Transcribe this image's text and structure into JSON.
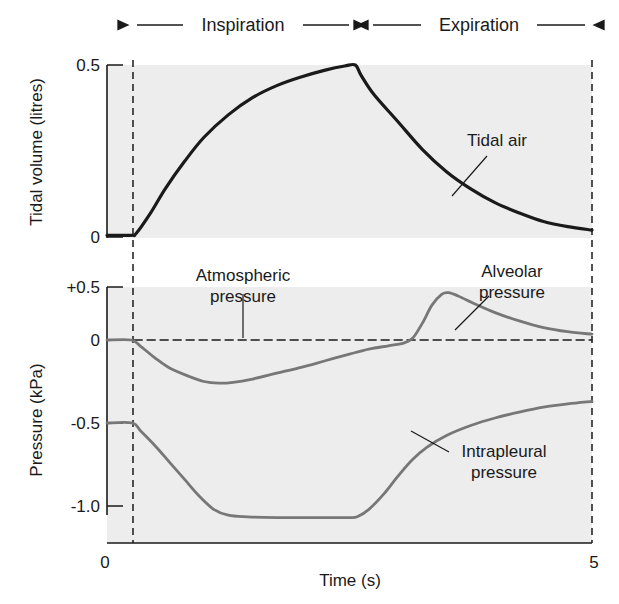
{
  "figure": {
    "phases": [
      {
        "label": "Inspiration",
        "arrow_left_x": 128,
        "arrow_right_x": 358,
        "text_x": 243,
        "text_y": 25
      },
      {
        "label": "Expiration",
        "arrow_left_x": 364,
        "arrow_right_x": 594,
        "text_x": 479,
        "text_y": 25
      }
    ],
    "axes": {
      "top": {
        "ylabel": "Tidal volume (litres)",
        "ticks": [
          "0.5",
          "0"
        ]
      },
      "bottom": {
        "ylabel": "Pressure (kPa)",
        "ticks": [
          "+0.5",
          "0",
          "-0.5",
          "-1.0"
        ]
      },
      "x": {
        "label": "Time (s)",
        "ticks": [
          "0",
          "5"
        ]
      }
    },
    "annotations": [
      {
        "name": "tidal-air",
        "lines": [
          "Tidal air"
        ],
        "x": 497,
        "y": 146
      },
      {
        "name": "atmospheric-pressure",
        "lines": [
          "Atmospheric",
          "pressure"
        ],
        "x": 243,
        "y": 281
      },
      {
        "name": "alveolar-pressure",
        "lines": [
          "Alveolar",
          "pressure"
        ],
        "x": 512,
        "y": 277
      },
      {
        "name": "intrapleural-pressure",
        "lines": [
          "Intrapleural",
          "pressure"
        ],
        "x": 504,
        "y": 457
      }
    ],
    "colors": {
      "plot_background": "#ededed",
      "axis": "#1a1a1a",
      "tidal_curve": "#1a1a1a",
      "pressure_curve": "#777777",
      "dashed_guide": "#1a1a1a"
    }
  },
  "chart_data": {
    "type": "line",
    "title": "",
    "xlabel": "Time (s)",
    "xlim": [
      0,
      5
    ],
    "x_ticks": [
      0,
      5
    ],
    "grid": false,
    "legend": "inline-annotations",
    "panels": [
      {
        "name": "tidal-volume",
        "ylabel": "Tidal volume (litres)",
        "ylim": [
          0,
          0.5
        ],
        "y_ticks": [
          0,
          0.5
        ],
        "series": [
          {
            "name": "Tidal air",
            "color": "#1a1a1a",
            "points": [
              [
                0.0,
                0.005
              ],
              [
                0.25,
                0.005
              ],
              [
                0.3,
                0.01
              ],
              [
                0.45,
                0.07
              ],
              [
                0.6,
                0.14
              ],
              [
                0.8,
                0.22
              ],
              [
                1.0,
                0.29
              ],
              [
                1.25,
                0.355
              ],
              [
                1.5,
                0.405
              ],
              [
                1.75,
                0.44
              ],
              [
                2.0,
                0.465
              ],
              [
                2.25,
                0.485
              ],
              [
                2.45,
                0.497
              ],
              [
                2.56,
                0.5
              ],
              [
                2.62,
                0.47
              ],
              [
                2.75,
                0.415
              ],
              [
                3.0,
                0.335
              ],
              [
                3.25,
                0.255
              ],
              [
                3.5,
                0.19
              ],
              [
                3.75,
                0.14
              ],
              [
                4.0,
                0.1
              ],
              [
                4.25,
                0.07
              ],
              [
                4.5,
                0.045
              ],
              [
                4.75,
                0.03
              ],
              [
                5.0,
                0.02
              ]
            ]
          }
        ]
      },
      {
        "name": "pressure",
        "ylabel": "Pressure (kPa)",
        "ylim": [
          -1.15,
          0.5
        ],
        "y_ticks": [
          0.5,
          0,
          -0.5,
          -1.0
        ],
        "series": [
          {
            "name": "Atmospheric pressure",
            "color": "#1a1a1a",
            "style": "dashed",
            "points": [
              [
                0.28,
                0.0
              ],
              [
                5.0,
                0.0
              ]
            ]
          },
          {
            "name": "Alveolar pressure",
            "color": "#777777",
            "points": [
              [
                0.0,
                0.0
              ],
              [
                0.25,
                0.0
              ],
              [
                0.35,
                -0.04
              ],
              [
                0.5,
                -0.11
              ],
              [
                0.65,
                -0.17
              ],
              [
                0.85,
                -0.22
              ],
              [
                1.0,
                -0.25
              ],
              [
                1.15,
                -0.26
              ],
              [
                1.3,
                -0.255
              ],
              [
                1.5,
                -0.235
              ],
              [
                1.75,
                -0.2
              ],
              [
                2.0,
                -0.165
              ],
              [
                2.25,
                -0.125
              ],
              [
                2.5,
                -0.085
              ],
              [
                2.7,
                -0.055
              ],
              [
                2.9,
                -0.035
              ],
              [
                3.05,
                -0.02
              ],
              [
                3.15,
                0.01
              ],
              [
                3.25,
                0.1
              ],
              [
                3.35,
                0.21
              ],
              [
                3.45,
                0.275
              ],
              [
                3.52,
                0.285
              ],
              [
                3.62,
                0.265
              ],
              [
                3.8,
                0.215
              ],
              [
                4.0,
                0.165
              ],
              [
                4.25,
                0.115
              ],
              [
                4.5,
                0.075
              ],
              [
                4.75,
                0.05
              ],
              [
                5.0,
                0.035
              ]
            ]
          },
          {
            "name": "Intrapleural pressure",
            "color": "#777777",
            "points": [
              [
                0.0,
                -0.5
              ],
              [
                0.26,
                -0.5
              ],
              [
                0.35,
                -0.55
              ],
              [
                0.5,
                -0.64
              ],
              [
                0.65,
                -0.74
              ],
              [
                0.8,
                -0.84
              ],
              [
                0.95,
                -0.94
              ],
              [
                1.1,
                -1.02
              ],
              [
                1.25,
                -1.055
              ],
              [
                1.45,
                -1.065
              ],
              [
                1.75,
                -1.07
              ],
              [
                2.1,
                -1.07
              ],
              [
                2.4,
                -1.07
              ],
              [
                2.5,
                -1.07
              ],
              [
                2.58,
                -1.065
              ],
              [
                2.7,
                -1.02
              ],
              [
                2.85,
                -0.93
              ],
              [
                3.0,
                -0.82
              ],
              [
                3.15,
                -0.72
              ],
              [
                3.3,
                -0.645
              ],
              [
                3.5,
                -0.575
              ],
              [
                3.75,
                -0.515
              ],
              [
                4.0,
                -0.47
              ],
              [
                4.25,
                -0.435
              ],
              [
                4.5,
                -0.405
              ],
              [
                4.75,
                -0.385
              ],
              [
                5.0,
                -0.37
              ]
            ]
          }
        ]
      }
    ]
  }
}
